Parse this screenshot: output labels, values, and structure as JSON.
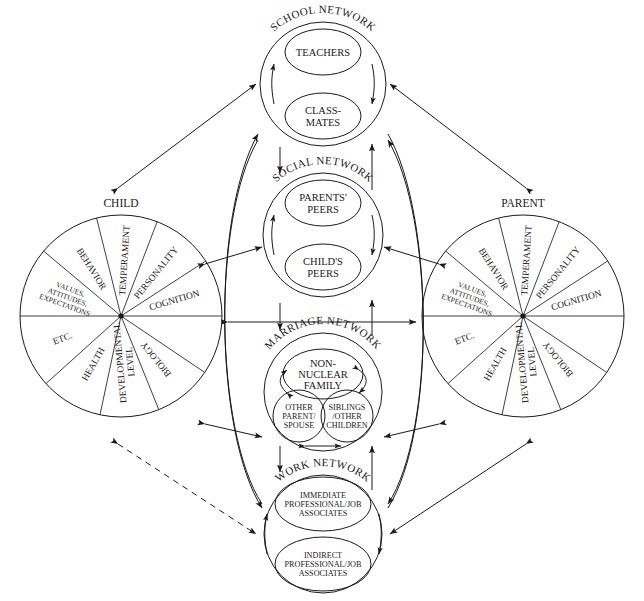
{
  "diagram": {
    "background_color": "#ffffff",
    "line_color": "#1a1a1a"
  },
  "wheels": [
    {
      "id": "child",
      "title": "CHILD",
      "cx": 121,
      "cy": 316,
      "r": 101,
      "segments": [
        {
          "label": "COGNITION",
          "lines": [
            "COGNITION"
          ]
        },
        {
          "label": "PERSONALITY",
          "lines": [
            "PERSONALITY"
          ]
        },
        {
          "label": "TEMPERAMENT",
          "lines": [
            "TEMPERAMENT"
          ]
        },
        {
          "label": "BEHAVIOR",
          "lines": [
            "BEHAVIOR"
          ]
        },
        {
          "label": "VALUES, ATTITUDES, EXPECTATIONS",
          "lines": [
            "VALUES,",
            "ATTITUDES,",
            "EXPECTATIONS"
          ]
        },
        {
          "label": "ETC.",
          "lines": [
            "ETC."
          ]
        },
        {
          "label": "HEALTH",
          "lines": [
            "HEALTH"
          ]
        },
        {
          "label": "DEVELOPMENTAL LEVEL",
          "lines": [
            "DEVELOPMENTAL",
            "LEVEL"
          ]
        },
        {
          "label": "BIOLOGY",
          "lines": [
            "BIOLOGY"
          ]
        }
      ]
    },
    {
      "id": "parent",
      "title": "PARENT",
      "cx": 523,
      "cy": 316,
      "r": 101,
      "segments": [
        {
          "label": "COGNITION",
          "lines": [
            "COGNITION"
          ]
        },
        {
          "label": "PERSONALITY",
          "lines": [
            "PERSONALITY"
          ]
        },
        {
          "label": "TEMPERAMENT",
          "lines": [
            "TEMPERAMENT"
          ]
        },
        {
          "label": "BEHAVIOR",
          "lines": [
            "BEHAVIOR"
          ]
        },
        {
          "label": "VALUES, ATTITUDES, EXPECTATIONS",
          "lines": [
            "VALUES,",
            "ATTITUDES,",
            "EXPECTATIONS"
          ]
        },
        {
          "label": "ETC.",
          "lines": [
            "ETC."
          ]
        },
        {
          "label": "HEALTH",
          "lines": [
            "HEALTH"
          ]
        },
        {
          "label": "DEVELOPMENTAL LEVEL",
          "lines": [
            "DEVELOPMENTAL",
            "LEVEL"
          ]
        },
        {
          "label": "BIOLOGY",
          "lines": [
            "BIOLOGY"
          ]
        }
      ]
    }
  ],
  "networks": [
    {
      "id": "school",
      "label": "SCHOOL NETWORK",
      "nodes": [
        {
          "id": "teachers",
          "lines": [
            "TEACHERS"
          ]
        },
        {
          "id": "classmates",
          "lines": [
            "CLASS-",
            "MATES"
          ]
        }
      ]
    },
    {
      "id": "social",
      "label": "SOCIAL NETWORK",
      "nodes": [
        {
          "id": "parents-peers",
          "lines": [
            "PARENTS'",
            "PEERS"
          ]
        },
        {
          "id": "childs-peers",
          "lines": [
            "CHILD'S",
            "PEERS"
          ]
        }
      ]
    },
    {
      "id": "marriage",
      "label": "MARRIAGE NETWORK",
      "nodes": [
        {
          "id": "non-nuclear-family",
          "lines": [
            "NON-",
            "NUCLEAR",
            "FAMILY"
          ]
        },
        {
          "id": "other-parent-spouse",
          "lines": [
            "OTHER",
            "PARENT/",
            "SPOUSE"
          ]
        },
        {
          "id": "siblings-other-children",
          "lines": [
            "SIBLINGS",
            "/OTHER",
            "CHILDREN"
          ]
        }
      ]
    },
    {
      "id": "work",
      "label": "WORK NETWORK",
      "nodes": [
        {
          "id": "immediate-associates",
          "lines": [
            "IMMEDIATE",
            "PROFESSIONAL/JOB",
            "ASSOCIATES"
          ]
        },
        {
          "id": "indirect-associates",
          "lines": [
            "INDIRECT",
            "PROFESSIONAL/JOB",
            "ASSOCIATES"
          ]
        }
      ]
    }
  ],
  "connections": [
    {
      "from": "child",
      "to": "school",
      "style": "solid",
      "heads": "both"
    },
    {
      "from": "parent",
      "to": "school",
      "style": "solid",
      "heads": "both"
    },
    {
      "from": "child",
      "to": "social",
      "style": "solid",
      "heads": "both"
    },
    {
      "from": "parent",
      "to": "social",
      "style": "solid",
      "heads": "both"
    },
    {
      "from": "child",
      "to": "parent",
      "style": "solid",
      "heads": "both"
    },
    {
      "from": "child",
      "to": "marriage",
      "style": "solid",
      "heads": "both"
    },
    {
      "from": "parent",
      "to": "marriage",
      "style": "solid",
      "heads": "both"
    },
    {
      "from": "child",
      "to": "work",
      "style": "dashed",
      "heads": "both"
    },
    {
      "from": "parent",
      "to": "work",
      "style": "solid",
      "heads": "both"
    },
    {
      "from": "school",
      "to": "social",
      "style": "solid",
      "heads": "single"
    },
    {
      "from": "social",
      "to": "marriage",
      "style": "solid",
      "heads": "single"
    },
    {
      "from": "marriage",
      "to": "work",
      "style": "solid",
      "heads": "single"
    },
    {
      "from": "work",
      "to": "marriage",
      "style": "solid",
      "heads": "single"
    },
    {
      "from": "marriage",
      "to": "social",
      "style": "solid",
      "heads": "single"
    },
    {
      "from": "social",
      "to": "school",
      "style": "solid",
      "heads": "single"
    },
    {
      "from": "work",
      "to": "school",
      "style": "curved",
      "heads": "single"
    },
    {
      "from": "school",
      "to": "work",
      "style": "curved",
      "heads": "single"
    }
  ]
}
